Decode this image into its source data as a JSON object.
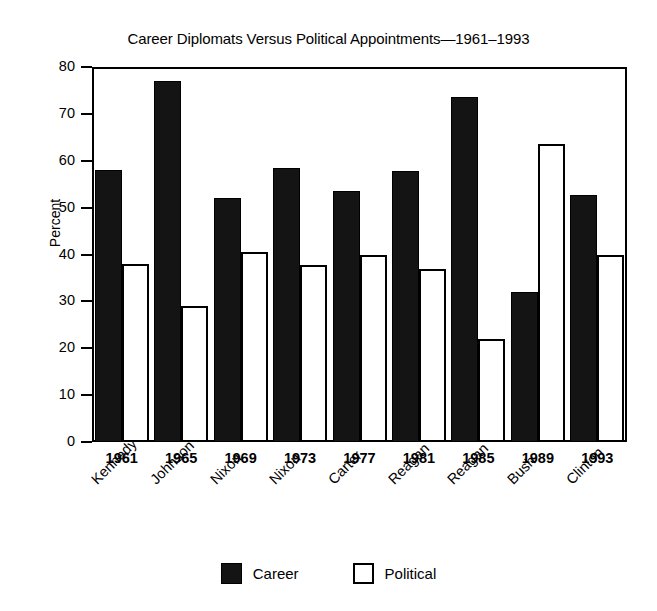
{
  "chart_data": {
    "type": "bar",
    "title": "Career Diplomats Versus Political Appointments—1961–1993",
    "xlabel": "",
    "ylabel": "Percent",
    "ylim": [
      0,
      80
    ],
    "ytick_step": 10,
    "yticks": [
      80,
      70,
      60,
      50,
      40,
      30,
      20,
      10,
      0
    ],
    "grid": false,
    "legend_position": "bottom-center",
    "categories": [
      "1961",
      "1965",
      "1969",
      "1973",
      "1977",
      "1981",
      "1985",
      "1989",
      "1993"
    ],
    "category_sublabels": [
      "Kennedy",
      "Johnson",
      "Nixon",
      "Nixon",
      "Carter",
      "Reagan",
      "Reagan",
      "Bush",
      "Clinton"
    ],
    "series": [
      {
        "name": "Career",
        "color": "#141414",
        "values": [
          58.0,
          77.0,
          52.0,
          58.5,
          53.5,
          57.8,
          73.5,
          32.0,
          52.7
        ]
      },
      {
        "name": "Political",
        "color": "#ffffff",
        "values": [
          38.0,
          29.0,
          40.5,
          37.8,
          39.8,
          37.0,
          22.0,
          63.5,
          40.0
        ]
      }
    ]
  },
  "legend": {
    "entries": [
      {
        "label": "Career"
      },
      {
        "label": "Political"
      }
    ]
  },
  "colors": {
    "career_fill": "#141414",
    "political_fill": "#ffffff",
    "axis": "#000000",
    "background": "#ffffff"
  }
}
